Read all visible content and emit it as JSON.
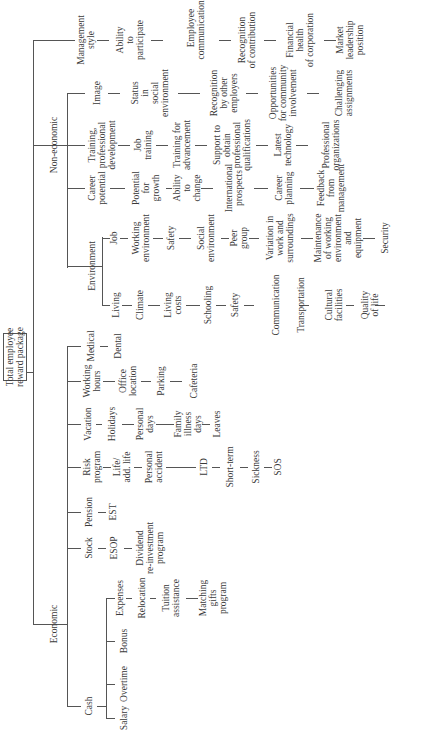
{
  "root": "Total employee\nreward package",
  "branches": {
    "non_economic": "Non-economic",
    "economic": "Economic"
  },
  "columns": [
    {
      "id": "management",
      "items": [
        "Management\nstyle",
        "Ability\nto\nparticipate",
        "Employee\ncommunications",
        "Recognition\nof contribution",
        "Financial\nhealth\nof corporation",
        "Market\nleadership\nposition"
      ]
    },
    {
      "id": "image",
      "items": [
        "Image",
        "Status\nin\nsocial\nenvironment",
        "Recognition\nby other\nemployers",
        "Opportunities\nfor community\ninvolvement",
        "Challenging\nassignments"
      ]
    },
    {
      "id": "training",
      "items": [
        "Training,\nprofessional\ndevelopment",
        "Job\ntraining",
        "Training for\nadvancement",
        "Support to\nobtain\nprofessional\nqualifications",
        "Latest\ntechnology",
        "Professional\norganizations"
      ]
    },
    {
      "id": "career",
      "items": [
        "Career\npotential",
        "Potential\nfor\ngrowth",
        "Ability\nto\nchange",
        "International\nprospects",
        "Career\nplanning",
        "Feedback\nfrom\nmanagement"
      ]
    },
    {
      "id": "environment",
      "label": "Environment"
    },
    {
      "id": "job",
      "items": [
        "Job",
        "Working\nenvironment",
        "Safety",
        "Social\nenvironment",
        "Peer\ngroup",
        "Variation in\nwork and\nsurroundings",
        "Maintenance\nof working\nenvironment\nand\nequipment",
        "Security"
      ]
    },
    {
      "id": "living",
      "items": [
        "Living",
        "Climate",
        "Living\ncosts",
        "Schooling",
        "Safety",
        "Communication",
        "Transportation",
        "Cultural\nfacilities",
        "Quality\nof life"
      ]
    },
    {
      "id": "medical",
      "items": [
        "Medical",
        "Dental"
      ]
    },
    {
      "id": "working_hours",
      "items": [
        "Working\nhours",
        "Office\nlocation",
        "Parking",
        "Cafeteria"
      ]
    },
    {
      "id": "vacation",
      "items": [
        "Vacation",
        "Holidays",
        "Personal\ndays",
        "Family\nillness\ndays",
        "Leaves"
      ]
    },
    {
      "id": "risk",
      "items": [
        "Risk\nprogram",
        "Life/\nadd. life",
        "Personal\naccident",
        "LTD",
        "Short-term",
        "Sickness",
        "SOS"
      ]
    },
    {
      "id": "pension",
      "items": [
        "Pension",
        "EST"
      ]
    },
    {
      "id": "stock",
      "items": [
        "Stock",
        "ESOP",
        "Dividend\nre-investment\nprogram"
      ]
    },
    {
      "id": "cash",
      "label": "Cash"
    },
    {
      "id": "expenses",
      "items": [
        "Expenses",
        "Relocation",
        "Tuition\nassistance",
        "Matching\ngifts\nprogram"
      ]
    },
    {
      "id": "bonus",
      "items": [
        "Bonus"
      ]
    },
    {
      "id": "overtime",
      "items": [
        "Overtime"
      ]
    },
    {
      "id": "salary",
      "items": [
        "Salary"
      ]
    }
  ]
}
